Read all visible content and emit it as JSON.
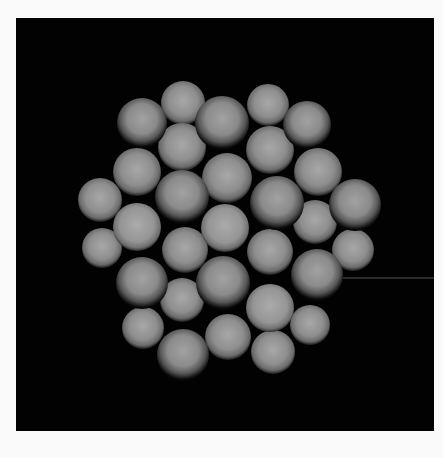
{
  "scene": {
    "description": "Rendered cluster of close-packed gray spheres on black background",
    "background_color": "#020202",
    "page_color": "#fafafa",
    "panel": {
      "x": 16,
      "y": 18,
      "width": 418,
      "height": 413
    },
    "pointer_line": {
      "x1": 343,
      "y1": 278,
      "x2": 434,
      "y2": 278,
      "color": "#555555"
    },
    "sphere_colors": {
      "back": {
        "light": "#a8a8a8",
        "mid": "#8c8c8c",
        "edge": "#1a1a1a"
      },
      "front": {
        "light": "#a4a4a4",
        "mid": "#8a8a8a",
        "edge": "#0a0a0a"
      }
    },
    "back_spheres": [
      {
        "cx": 183,
        "cy": 103,
        "r": 22
      },
      {
        "cx": 268,
        "cy": 105,
        "r": 21
      },
      {
        "cx": 182,
        "cy": 147,
        "r": 24
      },
      {
        "cx": 270,
        "cy": 150,
        "r": 24
      },
      {
        "cx": 137,
        "cy": 172,
        "r": 24
      },
      {
        "cx": 227,
        "cy": 178,
        "r": 25
      },
      {
        "cx": 318,
        "cy": 172,
        "r": 24
      },
      {
        "cx": 100,
        "cy": 200,
        "r": 22
      },
      {
        "cx": 315,
        "cy": 222,
        "r": 22
      },
      {
        "cx": 102,
        "cy": 248,
        "r": 20
      },
      {
        "cx": 185,
        "cy": 250,
        "r": 23
      },
      {
        "cx": 270,
        "cy": 252,
        "r": 23
      },
      {
        "cx": 353,
        "cy": 250,
        "r": 21
      },
      {
        "cx": 182,
        "cy": 300,
        "r": 22
      },
      {
        "cx": 143,
        "cy": 328,
        "r": 21
      },
      {
        "cx": 228,
        "cy": 337,
        "r": 23
      },
      {
        "cx": 310,
        "cy": 325,
        "r": 20
      },
      {
        "cx": 273,
        "cy": 352,
        "r": 22
      }
    ],
    "front_spheres": [
      {
        "cx": 142,
        "cy": 123,
        "r": 25
      },
      {
        "cx": 222,
        "cy": 123,
        "r": 27
      },
      {
        "cx": 307,
        "cy": 125,
        "r": 24
      },
      {
        "cx": 182,
        "cy": 197,
        "r": 27
      },
      {
        "cx": 277,
        "cy": 203,
        "r": 27
      },
      {
        "cx": 355,
        "cy": 205,
        "r": 26
      },
      {
        "cx": 137,
        "cy": 227,
        "r": 24,
        "shade": "light"
      },
      {
        "cx": 225,
        "cy": 228,
        "r": 24,
        "shade": "light"
      },
      {
        "cx": 142,
        "cy": 283,
        "r": 26
      },
      {
        "cx": 223,
        "cy": 283,
        "r": 27
      },
      {
        "cx": 317,
        "cy": 275,
        "r": 26
      },
      {
        "cx": 270,
        "cy": 308,
        "r": 24,
        "shade": "light"
      },
      {
        "cx": 183,
        "cy": 355,
        "r": 26
      }
    ]
  }
}
